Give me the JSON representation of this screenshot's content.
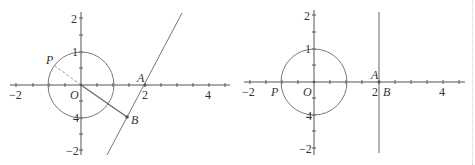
{
  "colors": {
    "axis": "#555555",
    "curve": "#777777",
    "text": "#333333",
    "dashed": "#9a9a9a"
  },
  "panels": [
    {
      "name": "left-figure",
      "x_ticks": {
        "neg2": "−2",
        "pos2": "2",
        "pos4": "4"
      },
      "y_ticks": {
        "pos2": "2",
        "pos1": "1",
        "neg1": "4",
        "neg2": "−2"
      },
      "points": {
        "P": "P",
        "O": "O",
        "A": "A",
        "B": "B"
      }
    },
    {
      "name": "right-figure",
      "x_ticks": {
        "neg2": "−2",
        "pos2": "2",
        "pos4": "4"
      },
      "y_ticks": {
        "pos2": "2",
        "pos1": "1",
        "neg1": "4",
        "neg2": "−2"
      },
      "points": {
        "P": "P",
        "O": "O",
        "A": "A",
        "B": "B"
      }
    }
  ]
}
